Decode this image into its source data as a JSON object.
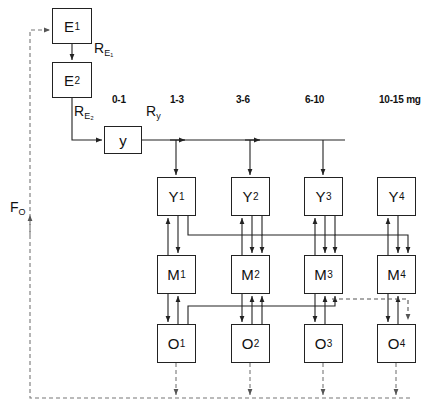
{
  "diagram": {
    "colors": {
      "stroke": "#222222",
      "background": "#ffffff",
      "text": "#111111"
    },
    "dose_headers": [
      {
        "text": "0-1",
        "x": 112,
        "y": 100
      },
      {
        "text": "1-3",
        "x": 170,
        "y": 100
      },
      {
        "text": "3-6",
        "x": 236,
        "y": 100
      },
      {
        "text": "6-10",
        "x": 305,
        "y": 100
      },
      {
        "text": "10-15 mg",
        "x": 379,
        "y": 100
      }
    ],
    "boxes": {
      "e1": {
        "label": "E",
        "sub": "1",
        "x": 52,
        "y": 8,
        "w": 40,
        "h": 36
      },
      "e2": {
        "label": "E",
        "sub": "2",
        "x": 52,
        "y": 62,
        "w": 40,
        "h": 36
      },
      "y": {
        "label": "y",
        "sub": "",
        "x": 104,
        "y": 126,
        "w": 38,
        "h": 28
      },
      "Y1": {
        "label": "Y",
        "sub": "1",
        "x": 157,
        "y": 177,
        "w": 39,
        "h": 39
      },
      "Y2": {
        "label": "Y",
        "sub": "2",
        "x": 231,
        "y": 177,
        "w": 39,
        "h": 39
      },
      "Y3": {
        "label": "Y",
        "sub": "3",
        "x": 304,
        "y": 177,
        "w": 39,
        "h": 39
      },
      "Y4": {
        "label": "Y",
        "sub": "4",
        "x": 377,
        "y": 177,
        "w": 39,
        "h": 39
      },
      "M1": {
        "label": "M",
        "sub": "1",
        "x": 157,
        "y": 255,
        "w": 39,
        "h": 39
      },
      "M2": {
        "label": "M",
        "sub": "2",
        "x": 231,
        "y": 255,
        "w": 39,
        "h": 39
      },
      "M3": {
        "label": "M",
        "sub": "3",
        "x": 304,
        "y": 255,
        "w": 39,
        "h": 39
      },
      "M4": {
        "label": "M",
        "sub": "4",
        "x": 377,
        "y": 255,
        "w": 39,
        "h": 39
      },
      "O1": {
        "label": "O",
        "sub": "1",
        "x": 157,
        "y": 324,
        "w": 39,
        "h": 39
      },
      "O2": {
        "label": "O",
        "sub": "2",
        "x": 231,
        "y": 324,
        "w": 39,
        "h": 39
      },
      "O3": {
        "label": "O",
        "sub": "3",
        "x": 304,
        "y": 324,
        "w": 39,
        "h": 39
      },
      "O4": {
        "label": "O",
        "sub": "4",
        "x": 377,
        "y": 324,
        "w": 39,
        "h": 39
      }
    },
    "edge_labels": [
      {
        "name": "r-e1",
        "label": "R",
        "sub": "E₁",
        "x": 94,
        "y": 46
      },
      {
        "name": "r-e2",
        "label": "R",
        "sub": "E₂",
        "x": 74,
        "y": 108
      },
      {
        "name": "r-y",
        "label": "R",
        "sub": "y",
        "x": 146,
        "y": 107
      },
      {
        "name": "f-o",
        "label": "F",
        "sub": "O",
        "x": 12,
        "y": 204
      }
    ]
  }
}
